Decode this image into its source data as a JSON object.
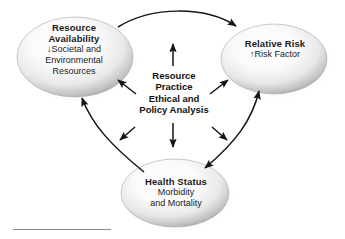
{
  "figure": {
    "type": "conceptual-cycle-diagram",
    "background_color": "#ffffff",
    "text_color": "#1a1a1a"
  },
  "center": {
    "name": "resource-practice-ethical-policy-analysis",
    "lines": [
      "Resource",
      "Practice",
      "Ethical and",
      "Policy Analysis"
    ],
    "line1": "Resource",
    "line2": "Practice",
    "line3": "Ethical and",
    "line4": "Policy Analysis"
  },
  "nodes": [
    {
      "id": "resource-availability",
      "title": "Resource",
      "title2": "Availability",
      "sub1": "↓Societal and",
      "sub2": "Environmental",
      "sub3": "Resources",
      "position": "top-left"
    },
    {
      "id": "relative-risk",
      "title": "Relative Risk",
      "sub1": "↑Risk Factor",
      "position": "top-right"
    },
    {
      "id": "health-status",
      "title": "Health Status",
      "sub1": "Morbidity",
      "sub2": "and Mortality",
      "position": "bottom-center"
    }
  ],
  "connections": [
    {
      "id": "availability-to-risk",
      "from": "resource-availability",
      "to": "relative-risk",
      "style": "curved",
      "heads": "end"
    },
    {
      "id": "risk-health-bidirectional",
      "from": "relative-risk",
      "to": "health-status",
      "style": "curved",
      "heads": "both"
    },
    {
      "id": "health-to-availability",
      "from": "health-status",
      "to": "resource-availability",
      "style": "curved",
      "heads": "end"
    },
    {
      "id": "center-up",
      "from": "center",
      "to": "up",
      "style": "straight",
      "heads": "end"
    },
    {
      "id": "center-down",
      "from": "center",
      "to": "health-status",
      "style": "straight",
      "heads": "end"
    },
    {
      "id": "center-up-left",
      "from": "center",
      "to": "resource-availability",
      "style": "straight-diagonal",
      "heads": "end"
    },
    {
      "id": "center-up-right",
      "from": "center",
      "to": "relative-risk",
      "style": "straight-diagonal",
      "heads": "end"
    },
    {
      "id": "center-down-left",
      "from": "center",
      "to": "lower-left",
      "style": "straight-diagonal",
      "heads": "end"
    },
    {
      "id": "center-down-right",
      "from": "center",
      "to": "lower-right",
      "style": "straight-diagonal",
      "heads": "end"
    }
  ],
  "colors": {
    "ellipse_rim": "#9a9a9a",
    "ellipse_center": "#fdfdfd",
    "arrow": "#151515",
    "rule": "#8d8d8d"
  }
}
